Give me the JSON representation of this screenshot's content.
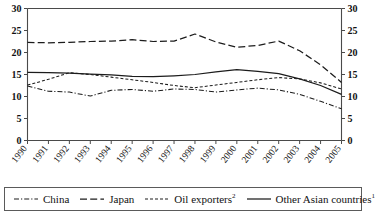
{
  "chart_data": {
    "type": "line",
    "title": "",
    "xlabel": "",
    "ylabel": "",
    "xlim": [
      1990,
      2005
    ],
    "ylim": [
      0,
      30
    ],
    "grid": false,
    "legend_position": "bottom",
    "dual_y_axis": true,
    "x": [
      1990,
      1991,
      1992,
      1993,
      1994,
      1995,
      1996,
      1997,
      1998,
      1999,
      2000,
      2001,
      2002,
      2003,
      2004,
      2005
    ],
    "categories": [
      "1990",
      "1991",
      "1992",
      "1993",
      "1994",
      "1995",
      "1996",
      "1997",
      "1998",
      "1999",
      "2000",
      "2001",
      "2002",
      "2003",
      "2004",
      "2005"
    ],
    "ytick_labels": [
      "0",
      "5",
      "10",
      "15",
      "20",
      "25",
      "30"
    ],
    "ytick_values": [
      0,
      5,
      10,
      15,
      20,
      25,
      30
    ],
    "ytick_labels_right": [
      "0",
      "5",
      "10",
      "15",
      "20",
      "25",
      "30"
    ],
    "series": [
      {
        "name": "China",
        "style": "dash-dot",
        "values": [
          12.4,
          11.2,
          11.0,
          10.1,
          11.4,
          11.6,
          11.2,
          11.7,
          11.6,
          11.0,
          11.5,
          11.9,
          11.5,
          10.5,
          8.9,
          7.2
        ]
      },
      {
        "name": "Japan",
        "style": "dashed",
        "values": [
          22.3,
          22.2,
          22.3,
          22.5,
          22.6,
          22.9,
          22.5,
          22.6,
          24.2,
          22.4,
          21.2,
          21.6,
          22.6,
          20.4,
          17.2,
          13.2
        ]
      },
      {
        "name": "Oil exporters",
        "style": "short-dash",
        "footnote": "2",
        "values": [
          12.6,
          13.9,
          15.4,
          15.0,
          14.4,
          13.8,
          13.2,
          12.5,
          12.0,
          12.6,
          13.2,
          13.8,
          14.3,
          14.0,
          13.1,
          11.7
        ]
      },
      {
        "name": "Other Asian countries",
        "style": "solid",
        "footnote": "1",
        "values": [
          15.5,
          15.4,
          15.3,
          15.1,
          14.9,
          14.6,
          14.5,
          14.7,
          15.0,
          15.6,
          16.1,
          15.7,
          15.2,
          14.0,
          12.5,
          10.5
        ]
      }
    ]
  },
  "legend": {
    "items": [
      {
        "label": "China",
        "footnote": ""
      },
      {
        "label": "Japan",
        "footnote": ""
      },
      {
        "label": "Oil exporters",
        "footnote": "2"
      },
      {
        "label": "Other Asian countries",
        "footnote": "1"
      }
    ]
  },
  "colors": {
    "line": "#1c1c1c",
    "axis": "#4a4a4a",
    "background": "#ffffff",
    "legend_border": "#5a5a5a"
  }
}
